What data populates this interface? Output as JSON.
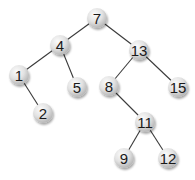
{
  "diagram": {
    "type": "binary-search-tree",
    "colors": {
      "background": "#ffffff",
      "edge": "#3a3a3a",
      "node_fill_light": "#f7f7f7",
      "node_fill_dark": "#bdbdbd",
      "node_shadow": "#9a9a9a",
      "label": "#1a1a1a"
    },
    "node_radius": 10,
    "nodes": [
      {
        "id": "n7",
        "label": "7",
        "x": 97,
        "y": 18
      },
      {
        "id": "n4",
        "label": "4",
        "x": 60,
        "y": 45
      },
      {
        "id": "n13",
        "label": "13",
        "x": 139,
        "y": 50
      },
      {
        "id": "n1",
        "label": "1",
        "x": 19,
        "y": 75
      },
      {
        "id": "n5",
        "label": "5",
        "x": 77,
        "y": 87
      },
      {
        "id": "n8",
        "label": "8",
        "x": 109,
        "y": 86
      },
      {
        "id": "n15",
        "label": "15",
        "x": 178,
        "y": 87
      },
      {
        "id": "n2",
        "label": "2",
        "x": 43,
        "y": 113
      },
      {
        "id": "n11",
        "label": "11",
        "x": 145,
        "y": 122
      },
      {
        "id": "n9",
        "label": "9",
        "x": 124,
        "y": 158
      },
      {
        "id": "n12",
        "label": "12",
        "x": 168,
        "y": 158
      }
    ],
    "edges": [
      {
        "from": "n7",
        "to": "n4"
      },
      {
        "from": "n7",
        "to": "n13"
      },
      {
        "from": "n4",
        "to": "n1"
      },
      {
        "from": "n4",
        "to": "n5"
      },
      {
        "from": "n1",
        "to": "n2"
      },
      {
        "from": "n13",
        "to": "n8"
      },
      {
        "from": "n13",
        "to": "n15"
      },
      {
        "from": "n8",
        "to": "n11"
      },
      {
        "from": "n11",
        "to": "n9"
      },
      {
        "from": "n11",
        "to": "n12"
      }
    ]
  }
}
